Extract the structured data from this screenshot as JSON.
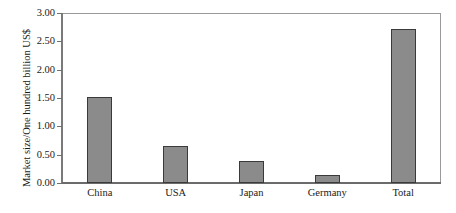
{
  "chart_data": {
    "type": "bar",
    "title": "",
    "subtitle": "",
    "xlabel": "",
    "ylabel": "Market size/One hundred billion US$",
    "categories": [
      "China",
      "USA",
      "Japan",
      "Germany",
      "Total"
    ],
    "values": [
      1.52,
      0.65,
      0.38,
      0.14,
      2.72
    ],
    "series": [
      {
        "name": "Market size",
        "values": [
          1.52,
          0.65,
          0.38,
          0.14,
          2.72
        ]
      }
    ],
    "ylim": [
      0.0,
      3.0
    ],
    "ytick_step": 0.5,
    "ytick_labels": [
      "0.00",
      "0.50",
      "1.00",
      "1.50",
      "2.00",
      "2.50",
      "3.00"
    ],
    "ytick_values": [
      0.0,
      0.5,
      1.0,
      1.5,
      2.0,
      2.5,
      3.0
    ],
    "grid": false,
    "legend": false,
    "legend_position": "none",
    "annotations": [],
    "colors": {
      "bar_fill": "#8b8b8b",
      "bar_border": "#3a3a3a",
      "axis": "#6f6f6f",
      "frame": "#8c8c8c",
      "text": "#1a1a1a",
      "background": "#ffffff"
    }
  }
}
